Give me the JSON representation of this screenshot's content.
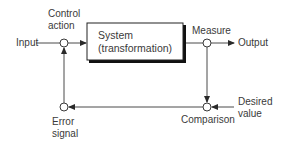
{
  "diagram": {
    "type": "feedback-control-loop",
    "nodes": {
      "input": {
        "label": "Input"
      },
      "control_action": {
        "label_line1": "Control",
        "label_line2": "action"
      },
      "system": {
        "label_line1": "System",
        "label_line2": "(transformation)"
      },
      "measure": {
        "label": "Measure"
      },
      "output": {
        "label": "Output"
      },
      "comparison": {
        "label": "Comparison"
      },
      "desired_value": {
        "label_line1": "Desired",
        "label_line2": "value"
      },
      "error_signal": {
        "label_line1": "Error",
        "label_line2": "signal"
      }
    },
    "edges": [
      {
        "from": "input",
        "to": "control_action"
      },
      {
        "from": "control_action",
        "to": "system"
      },
      {
        "from": "system",
        "to": "measure"
      },
      {
        "from": "measure",
        "to": "output"
      },
      {
        "from": "measure",
        "to": "comparison"
      },
      {
        "from": "desired_value",
        "to": "comparison"
      },
      {
        "from": "comparison",
        "to": "error_signal"
      },
      {
        "from": "error_signal",
        "to": "control_action"
      }
    ],
    "colors": {
      "line": "#4a4a4a",
      "text": "#3a3a3a",
      "box_shadow": "#111111"
    }
  }
}
